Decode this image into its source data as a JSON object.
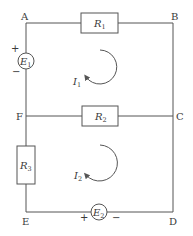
{
  "diagram": {
    "type": "circuit",
    "nodes": [
      {
        "id": "A",
        "label": "A"
      },
      {
        "id": "B",
        "label": "B"
      },
      {
        "id": "C",
        "label": "C"
      },
      {
        "id": "D",
        "label": "D"
      },
      {
        "id": "E",
        "label": "E"
      },
      {
        "id": "F",
        "label": "F"
      }
    ],
    "components": {
      "R1": {
        "symbol": "R",
        "subscript": "1",
        "between": [
          "A",
          "B"
        ]
      },
      "R2": {
        "symbol": "R",
        "subscript": "2",
        "between": [
          "F",
          "C"
        ]
      },
      "R3": {
        "symbol": "R",
        "subscript": "3",
        "between": [
          "F",
          "E"
        ]
      },
      "E1": {
        "symbol": "E",
        "subscript": "1",
        "between": [
          "A",
          "F"
        ],
        "plus": "+",
        "minus": "−"
      },
      "E2": {
        "symbol": "E",
        "subscript": "2",
        "between": [
          "E",
          "D"
        ],
        "plus": "+",
        "minus": "−"
      }
    },
    "loops": {
      "I1": {
        "symbol": "I",
        "subscript": "1",
        "direction": "clockwise"
      },
      "I2": {
        "symbol": "I",
        "subscript": "2",
        "direction": "clockwise"
      }
    },
    "wires": [
      [
        "A",
        "B"
      ],
      [
        "B",
        "C"
      ],
      [
        "C",
        "D"
      ],
      [
        "D",
        "E"
      ],
      [
        "E",
        "F"
      ],
      [
        "F",
        "A"
      ],
      [
        "F",
        "C"
      ]
    ],
    "colors": {
      "line": "#555555",
      "text": "#3a3a3a",
      "background": "#ffffff"
    }
  }
}
